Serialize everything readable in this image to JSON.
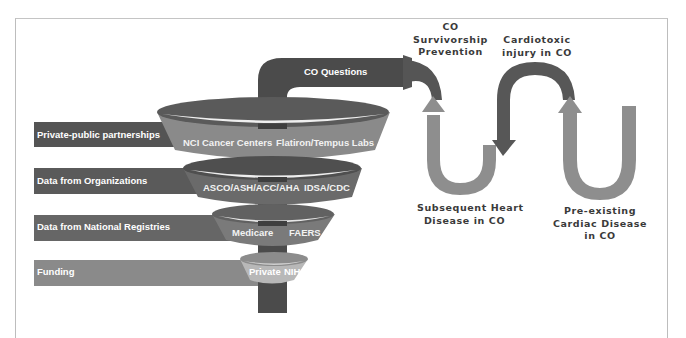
{
  "diagram": {
    "colors": {
      "dark": "#4b4b4b",
      "mid_dark": "#5e5e5e",
      "mid": "#707070",
      "light": "#8c8c8c",
      "lighter": "#a9a9a9",
      "funnel_tier1_band": "#8a8a8a",
      "funnel_tier4_band": "#b8b8b8",
      "curve_arrow_dark": "#575757",
      "curve_arrow_light": "#8e8e8e",
      "label_text": "#3a3a3a",
      "frame": "#bdbdbd"
    },
    "top_bar": {
      "label": "CO Questions"
    },
    "left_bars": [
      {
        "label": "Private-public partnerships"
      },
      {
        "label": "Data from Organizations"
      },
      {
        "label": "Data from National Registries"
      },
      {
        "label": "Funding"
      }
    ],
    "funnel_tiers": [
      {
        "items": [
          "NCI Cancer Centers",
          "Flatiron/Tempus Labs"
        ]
      },
      {
        "items": [
          "ASCO/ASH/ACC/AHA",
          "IDSA/CDC"
        ]
      },
      {
        "items": [
          "Medicare",
          "FAERS"
        ]
      },
      {
        "items": [
          "Private",
          "NIH"
        ]
      }
    ],
    "cycle_labels": {
      "survivorship": [
        "CO",
        "Survivorship",
        "Prevention"
      ],
      "cardiotoxic": [
        "Cardiotoxic",
        "injury in CO"
      ],
      "subsequent": [
        "Subsequent Heart",
        "Disease in CO"
      ],
      "preexisting": [
        "Pre-existing",
        "Cardiac Disease",
        "in CO"
      ]
    }
  }
}
